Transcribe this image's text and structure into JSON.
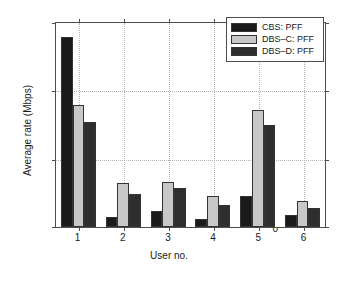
{
  "chart_data": {
    "type": "bar",
    "title": "",
    "xlabel": "User no.",
    "ylabel": "Average rate (Mbps)",
    "categories": [
      "1",
      "2",
      "3",
      "4",
      "5",
      "6"
    ],
    "xtick_labels": [
      "1",
      "2",
      "3",
      "4",
      "5",
      "6"
    ],
    "ytick_labels": [
      "0",
      "5",
      "10",
      "15"
    ],
    "ytick_values": [
      0,
      5,
      10,
      15
    ],
    "ylim": [
      0,
      15
    ],
    "xlim": [
      0.5,
      6.5
    ],
    "grid": true,
    "grid_style": "dotted",
    "legend_position": "upper-right",
    "series": [
      {
        "name": "CBS: PFF",
        "color": "#1a1a1a",
        "values": [
          14.0,
          0.75,
          1.2,
          0.6,
          2.3,
          0.9
        ]
      },
      {
        "name": "DBS-C: PFF",
        "color": "#c8c8c8",
        "values": [
          9.0,
          3.2,
          3.3,
          2.3,
          8.6,
          1.9
        ]
      },
      {
        "name": "DBS-D: PFF",
        "color": "#2e2e2e",
        "values": [
          7.7,
          2.4,
          2.9,
          1.6,
          7.5,
          1.4
        ]
      }
    ]
  },
  "legend": {
    "entries": [
      {
        "label": "CBS: PFF"
      },
      {
        "label": "DBS–C: PFF"
      },
      {
        "label": "DBS–D: PFF"
      }
    ]
  },
  "colors": {
    "series_1": "#1a1a1a",
    "series_2": "#c8c8c8",
    "series_3": "#2e2e2e",
    "axis": "#4d4d4d",
    "grid": "#b4b4b4",
    "background": "#ffffff",
    "text": "#1a1a1a"
  }
}
